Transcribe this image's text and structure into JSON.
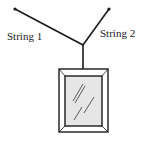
{
  "diagram": {
    "labels": {
      "string1": "String 1",
      "string2": "String 2"
    },
    "colors": {
      "stroke": "#1a1a1a",
      "glass": "#e6e6e6",
      "background": "#ffffff"
    },
    "elements": [
      "string-1",
      "string-2",
      "hanging-string",
      "picture-frame",
      "glass-reflection"
    ]
  }
}
